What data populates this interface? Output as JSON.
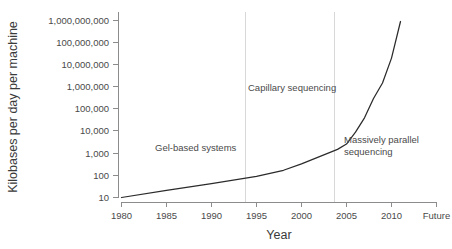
{
  "chart_data": {
    "type": "line",
    "title": "",
    "xlabel": "Year",
    "ylabel": "Kilobases per day per machine",
    "yscale": "log",
    "ylim": [
      10,
      1000000000
    ],
    "grid": false,
    "legend": "none",
    "xtick_labels": [
      "1980",
      "1985",
      "1990",
      "1995",
      "2000",
      "2005",
      "2010",
      "Future"
    ],
    "ytick_labels": [
      "1,000,000,000",
      "100,000,000",
      "10,000,000",
      "1,000,000",
      "100,000",
      "10,000",
      "1,000",
      "100",
      "10"
    ],
    "ytick_values": [
      1000000000,
      100000000,
      10000000,
      1000000,
      100000,
      10000,
      1000,
      100,
      10
    ],
    "series": [
      {
        "name": "Sequencing throughput",
        "x": [
          1980,
          1985,
          1990,
          1995,
          1998,
          2000,
          2002,
          2004,
          2005,
          2006,
          2007,
          2008,
          2009,
          2010,
          2011
        ],
        "y": [
          10,
          21,
          42,
          90,
          170,
          330,
          700,
          1500,
          2600,
          9000,
          40000,
          300000,
          1500000,
          20000000,
          900000000
        ]
      }
    ],
    "annotations": [
      {
        "text": "Gel-based systems",
        "x": 1987.6,
        "y": 3000
      },
      {
        "text": "Capillary sequencing",
        "x": 1997.8,
        "y": 900000
      },
      {
        "text": "Massively parallel sequencing",
        "lines": [
          "Massively parallel",
          "sequencing"
        ],
        "x": 2006.9,
        "y": 2600
      }
    ],
    "era_dividers": [
      1993.5,
      2004.2
    ],
    "colors": {
      "line": "#2b2b2b",
      "axis": "#8c8c8c",
      "divider": "#d8d8d8",
      "text": "#4a4a4a",
      "background": "#ffffff"
    }
  }
}
